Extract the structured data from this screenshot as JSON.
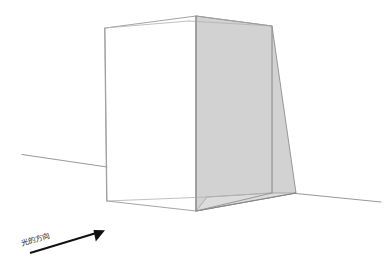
{
  "diagram": {
    "title": "",
    "caption_label": "光的方向",
    "canvas": {
      "width": 390,
      "height": 277,
      "background": "#ffffff"
    },
    "colors": {
      "background": "#ffffff",
      "box_edge": "#8d8d8d",
      "box_edge_light": "#b4b4b4",
      "box_face": "#ffffff",
      "shadow_fill": "#d2d2d2",
      "shadow_fill_ground": "#dedede",
      "shadow_edge": "#8a8a8a",
      "ground_line": "#9a9a9a",
      "arrow": "#111111",
      "text": "#1a1a1a"
    },
    "elements": {
      "ground_line_name": "ground-horizon-line",
      "box_name": "transparent-box",
      "shadow_name": "cast-shadow",
      "arrow_name": "light-direction-arrow"
    },
    "geometry": {
      "ground_left": [
        [
          22,
          154
        ],
        [
          107,
          167
        ]
      ],
      "ground_right": [
        [
          296,
          193
        ],
        [
          381,
          202
        ]
      ],
      "box_top_back_left": [
        105,
        28
      ],
      "box_top_apex": [
        196,
        16
      ],
      "box_top_back_right": [
        272,
        26
      ],
      "box_bottom_left": [
        107,
        201
      ],
      "box_bottom_front": [
        196,
        211
      ],
      "box_bottom_right": [
        272,
        193
      ],
      "shadow_far_bottom": [
        296,
        193
      ],
      "arrow_start": [
        30,
        253
      ],
      "arrow_end": [
        103,
        231
      ],
      "label_position": [
        22,
        245
      ],
      "label_rotation": -16
    }
  }
}
